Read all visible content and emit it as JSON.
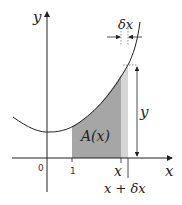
{
  "diagram": {
    "axes": {
      "x_label": "x",
      "y_label": "y"
    },
    "ticks": {
      "origin": "0",
      "one": "1",
      "x": "x",
      "x_plus_dx": "x + δx"
    },
    "labels": {
      "area": "A(x)",
      "delta_x": "δx",
      "height": "y"
    },
    "colors": {
      "shade_dark": "#a6a6a6",
      "shade_light": "#d6d6d6",
      "line": "#222222"
    }
  }
}
